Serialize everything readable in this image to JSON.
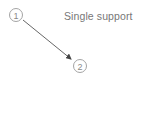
{
  "diagram": {
    "title": "Single support",
    "nodes": [
      {
        "id": "1",
        "label": "1",
        "cx": 16,
        "cy": 15,
        "r": 6.5
      },
      {
        "id": "2",
        "label": "2",
        "cx": 80,
        "cy": 66,
        "r": 6.5
      }
    ],
    "edges": [
      {
        "from": "1",
        "to": "2",
        "directed": true
      }
    ],
    "colors": {
      "node_stroke": "#9a9a9a",
      "node_text": "#8a8a8a",
      "arrow": "#555555",
      "label": "#777777"
    }
  }
}
